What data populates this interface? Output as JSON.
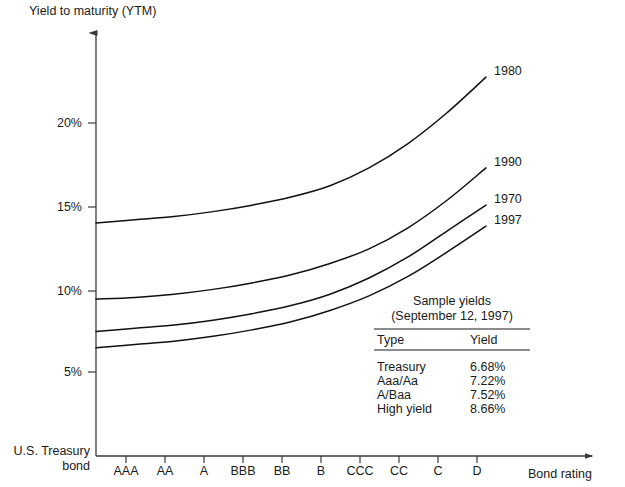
{
  "chart_data": {
    "type": "line",
    "title": "",
    "ylabel": "Yield to maturity (YTM)",
    "xlabel": "Bond rating",
    "origin_label_line1": "U.S. Treasury",
    "origin_label_line2": "bond",
    "categories": [
      "AAA",
      "AA",
      "A",
      "BBB",
      "BB",
      "B",
      "CCC",
      "CC",
      "C",
      "D"
    ],
    "yticks": [
      "5%",
      "10%",
      "15%",
      "20%"
    ],
    "ytick_values": [
      5,
      10,
      15,
      20
    ],
    "ylim": [
      3.0,
      24.5
    ],
    "grid": false,
    "legend_position": "right-of-curve-ends",
    "series": [
      {
        "name": "1980",
        "label": "1980",
        "x": [
          "U.S. Treasury bond",
          "AAA",
          "AA",
          "A",
          "BBB",
          "BB",
          "B",
          "CCC",
          "CC",
          "C",
          "D"
        ],
        "values": [
          14.2,
          14.4,
          14.6,
          14.9,
          15.3,
          15.8,
          16.5,
          17.6,
          19.1,
          21.0,
          23.2
        ]
      },
      {
        "name": "1990",
        "label": "1990",
        "x": [
          "U.S. Treasury bond",
          "AAA",
          "AA",
          "A",
          "BBB",
          "BB",
          "B",
          "CCC",
          "CC",
          "C",
          "D"
        ],
        "values": [
          9.5,
          9.6,
          9.8,
          10.1,
          10.5,
          11.0,
          11.7,
          12.6,
          13.9,
          15.6,
          17.6
        ]
      },
      {
        "name": "1970",
        "label": "1970",
        "x": [
          "U.S. Treasury bond",
          "AAA",
          "AA",
          "A",
          "BBB",
          "BB",
          "B",
          "CCC",
          "CC",
          "C",
          "D"
        ],
        "values": [
          7.5,
          7.7,
          7.9,
          8.2,
          8.6,
          9.1,
          9.8,
          10.8,
          12.1,
          13.7,
          15.3
        ]
      },
      {
        "name": "1997",
        "label": "1997",
        "x": [
          "U.S. Treasury bond",
          "AAA",
          "AA",
          "A",
          "BBB",
          "BB",
          "B",
          "CCC",
          "CC",
          "C",
          "D"
        ],
        "values": [
          6.5,
          6.7,
          6.9,
          7.2,
          7.6,
          8.1,
          8.8,
          9.7,
          10.9,
          12.4,
          14.0
        ]
      }
    ],
    "annotation_table": {
      "title_line1": "Sample yields",
      "title_line2": "(September 12, 1997)",
      "columns": [
        "Type",
        "Yield"
      ],
      "rows": [
        {
          "type": "Treasury",
          "yield": "6.68%"
        },
        {
          "type": "Aaa/Aa",
          "yield": "7.22%"
        },
        {
          "type": "A/Baa",
          "yield": "7.52%"
        },
        {
          "type": "High yield",
          "yield": "8.66%"
        }
      ]
    },
    "colors": {
      "curve": "#111111",
      "axis": "#3a3a3a",
      "text": "#1a1a1a",
      "background": "#ffffff"
    }
  }
}
